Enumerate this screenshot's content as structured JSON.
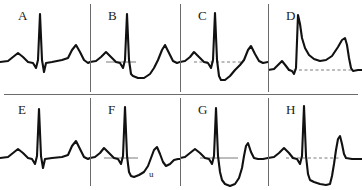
{
  "figure": {
    "background_color": "#ffffff",
    "trace_color": "#111111",
    "divider_color": "#6b6b6b",
    "reference_line_color": "#7a7a7a",
    "width": 362,
    "height": 190,
    "rows": 2,
    "columns": 4
  },
  "panels": [
    {
      "id": "A",
      "label": "A",
      "row": 1,
      "column": 1,
      "description": "Normal ECG complex with small P wave, tall narrow QRS, isoelectric ST segment and upright T wave",
      "reference_line": "none",
      "sublabel": "",
      "path": "M 0 62 L 8 61 L 13 57 L 18 53 L 23 57 L 28 62 L 33 63 L 36 68 L 38 60 L 40 14 L 42 60 L 44 72 L 46 63 L 52 62 L 62 60 L 68 58 L 72 50 L 76 45 L 80 52 L 84 60 L 88 63 L 90 62"
    },
    {
      "id": "B",
      "label": "B",
      "row": 1,
      "column": 2,
      "description": "Downsloping sagging ST segment depression below baseline with upright T wave",
      "reference_line": "solid",
      "reference_line_geometry": {
        "x1": 16,
        "y1": 62,
        "x2": 46,
        "y2": 62
      },
      "sublabel": "",
      "path": "M 0 62 L 6 61 L 11 57 L 16 52 L 21 57 L 26 62 L 30 63 L 33 68 L 35 60 L 37 14 L 39 60 L 41 74 L 43 76 L 48 78 L 54 78 L 60 74 L 64 68 L 68 60 L 72 50 L 75 45 L 79 53 L 83 61 L 87 63 L 90 62"
    },
    {
      "id": "C",
      "label": "C",
      "row": 1,
      "column": 3,
      "description": "Sharply downsloping ST depression rising back toward an upright T wave, with dashed isoelectric reference line",
      "reference_line": "dashed",
      "reference_line_geometry": {
        "x1": 14,
        "y1": 62,
        "x2": 62,
        "y2": 62
      },
      "sublabel": "",
      "path": "M 0 62 L 5 61 L 10 57 L 14 52 L 19 57 L 24 62 L 28 63 L 31 68 L 33 60 L 35 13 L 37 60 L 39 76 L 41 80 L 45 80 L 50 76 L 55 70 L 60 65 L 64 60 L 68 50 L 71 46 L 75 54 L 79 61 L 83 63 L 88 62"
    },
    {
      "id": "D",
      "label": "D",
      "row": 1,
      "column": 4,
      "description": "Marked convex ST segment elevation forming a dome that merges into a broad tall T wave, with dashed isoelectric reference line",
      "reference_line": "dashed",
      "reference_line_geometry": {
        "x1": 20,
        "y1": 70,
        "x2": 84,
        "y2": 70
      },
      "sublabel": "",
      "path": "M 0 70 L 6 69 L 10 65 L 14 61 L 18 66 L 21 70 L 24 71 L 26 74 L 28 68 L 30 15 L 32 24 L 34 38 L 37 48 L 41 55 L 46 59 L 52 61 L 58 60 L 64 56 L 70 47 L 74 40 L 77 38 L 79 45 L 81 58 L 83 68 L 85 71 L 90 70 L 94 70"
    },
    {
      "id": "E",
      "label": "E",
      "row": 2,
      "column": 1,
      "description": "Normal complex with flat isoelectric ST segment and upright T wave",
      "reference_line": "none",
      "sublabel": "",
      "path": "M 0 64 L 8 63 L 13 59 L 18 55 L 23 59 L 28 64 L 32 65 L 35 70 L 37 62 L 39 15 L 41 62 L 43 74 L 45 65 L 52 64 L 62 63 L 68 61 L 72 52 L 76 47 L 80 55 L 84 63 L 88 65 L 90 64"
    },
    {
      "id": "F",
      "label": "F",
      "row": 2,
      "column": 2,
      "description": "ST depression with upright T wave followed by a prominent U wave labelled u",
      "reference_line": "solid",
      "reference_line_geometry": {
        "x1": 14,
        "y1": 64,
        "x2": 48,
        "y2": 64
      },
      "sublabel": "u",
      "sublabel_position": {
        "x": 60,
        "y": 82
      },
      "path": "M 0 64 L 5 63 L 10 59 L 14 54 L 19 59 L 24 64 L 28 65 L 31 70 L 33 62 L 35 13 L 37 62 L 39 78 L 41 82 L 44 83 L 49 81 L 54 78 L 58 72 L 61 64 L 64 56 L 67 53 L 70 60 L 73 68 L 76 72 L 80 70 L 84 66 L 88 65 L 90 65"
    },
    {
      "id": "G",
      "label": "G",
      "row": 2,
      "column": 3,
      "description": "Deeply scooped concave ST segment depression returning sharply to an upright T wave",
      "reference_line": "solid",
      "reference_line_geometry": {
        "x1": 20,
        "y1": 64,
        "x2": 58,
        "y2": 64
      },
      "sublabel": "",
      "path": "M 0 64 L 5 63 L 10 59 L 15 55 L 20 59 L 25 64 L 29 65 L 32 70 L 34 62 L 36 14 L 38 62 L 40 78 L 42 86 L 45 90 L 50 92 L 55 90 L 59 84 L 62 74 L 64 62 L 66 52 L 68 49 L 71 58 L 74 64 L 78 65 L 83 65 L 88 64"
    },
    {
      "id": "H",
      "label": "H",
      "row": 2,
      "column": 4,
      "description": "Marked horizontal ST segment depression with sharp return to a tall peaked upright T wave, with dashed isoelectric reference line",
      "reference_line": "dashed",
      "reference_line_geometry": {
        "x1": 18,
        "y1": 64,
        "x2": 72,
        "y2": 64
      },
      "sublabel": "",
      "path": "M 0 64 L 6 63 L 11 59 L 16 54 L 21 59 L 25 64 L 29 65 L 32 70 L 34 62 L 36 12 L 38 62 L 40 80 L 42 86 L 46 88 L 52 90 L 58 91 L 62 90 L 64 82 L 66 70 L 68 56 L 70 45 L 72 42 L 74 50 L 76 60 L 78 64 L 84 65 L 90 65 L 94 65"
    }
  ]
}
